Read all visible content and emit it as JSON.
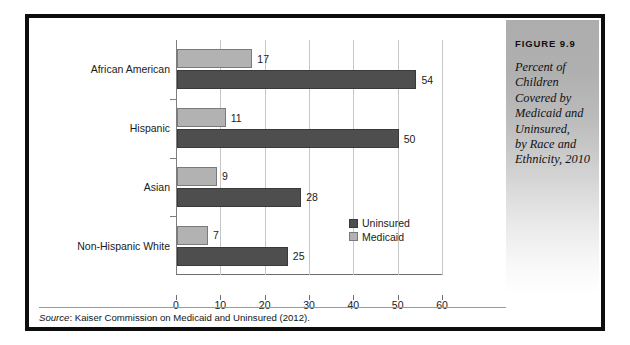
{
  "figure": {
    "number_label": "FIGURE 9.9",
    "caption_lines": [
      "Percent of",
      "Children",
      "Covered by",
      "Medicaid and",
      "Uninsured,",
      "by Race and",
      "Ethnicity, 2010"
    ]
  },
  "source": {
    "prefix": "Source",
    "text": ": Kaiser Commission on Medicaid and Uninsured (2012)."
  },
  "colors": {
    "uninsured": "#4e4e4e",
    "medicaid": "#b2b2b2",
    "frame": "#0d0d0d",
    "gridline": "#c6c6c6",
    "axis": "#6e6e6e"
  },
  "chart_data": {
    "type": "bar",
    "orientation": "horizontal",
    "xlabel": "",
    "ylabel": "",
    "xlim": [
      0,
      60
    ],
    "xticks": [
      0,
      10,
      20,
      30,
      40,
      50,
      60
    ],
    "xtick_labels": [
      "0",
      "10",
      "20",
      "30",
      "40",
      "50",
      "60"
    ],
    "grid": true,
    "legend_position": "inside-right",
    "categories": [
      "African American",
      "Hispanic",
      "Asian",
      "Non-Hispanic White"
    ],
    "series": [
      {
        "name": "Medicaid",
        "values": [
          17,
          11,
          9,
          7
        ]
      },
      {
        "name": "Uninsured",
        "values": [
          54,
          50,
          28,
          25
        ]
      }
    ],
    "data_labels": {
      "Medicaid": [
        "17",
        "11",
        "9",
        "7"
      ],
      "Uninsured": [
        "54",
        "50",
        "28",
        "25"
      ]
    },
    "legend": [
      {
        "label": "Uninsured",
        "color": "#4e4e4e"
      },
      {
        "label": "Medicaid",
        "color": "#b2b2b2"
      }
    ]
  }
}
